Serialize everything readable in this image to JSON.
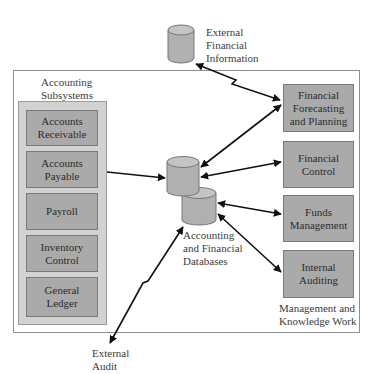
{
  "external": {
    "financial_info": [
      "External",
      "Financial",
      "Information"
    ],
    "audit": [
      "External",
      "Audit"
    ]
  },
  "accounting": {
    "heading": [
      "Accounting",
      "Subsystems"
    ],
    "items": [
      {
        "label": "Accounts\nReceivable"
      },
      {
        "label": "Accounts\nPayable"
      },
      {
        "label": "Payroll"
      },
      {
        "label": "Inventory\nControl"
      },
      {
        "label": "General\nLedger"
      }
    ]
  },
  "databases": {
    "label": [
      "Accounting",
      "and Financial",
      "Databases"
    ]
  },
  "management": {
    "heading": [
      "Management and",
      "Knowledge Work"
    ],
    "items": [
      {
        "label": "Financial\nForecasting\nand Planning"
      },
      {
        "label": "Financial\nControl"
      },
      {
        "label": "Funds\nManagement"
      },
      {
        "label": "Internal\nAuditing"
      }
    ]
  },
  "colors": {
    "box_fill": "#aaaaaa",
    "panel_fill": "#d2d2d2",
    "cylinder_fill": "#b0b0b0",
    "arrow": "#111111",
    "border": "#8f8f8f"
  }
}
